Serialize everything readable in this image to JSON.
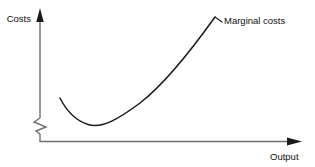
{
  "chart_data": {
    "type": "line",
    "title": "",
    "subtitle": "",
    "xlabel": "Output",
    "ylabel": "Costs",
    "grid": false,
    "legend_position": "inline-annotation",
    "axis_break": {
      "axis": "y",
      "symbol": "zigzag",
      "note": "y-axis broken near origin"
    },
    "annotations": [
      {
        "text": "Marginal costs",
        "target": "curve-upper-end",
        "leader_line": true
      }
    ],
    "series": [
      {
        "name": "Marginal costs",
        "shape": "u-shaped",
        "minimum": {
          "x": 0.21,
          "y": 0.1
        },
        "points": [
          {
            "x": 0.085,
            "y": 0.34
          },
          {
            "x": 0.1,
            "y": 0.24
          },
          {
            "x": 0.13,
            "y": 0.16
          },
          {
            "x": 0.17,
            "y": 0.115
          },
          {
            "x": 0.21,
            "y": 0.1
          },
          {
            "x": 0.26,
            "y": 0.115
          },
          {
            "x": 0.32,
            "y": 0.155
          },
          {
            "x": 0.4,
            "y": 0.235
          },
          {
            "x": 0.5,
            "y": 0.35
          },
          {
            "x": 0.6,
            "y": 0.49
          },
          {
            "x": 0.7,
            "y": 0.64
          },
          {
            "x": 0.8,
            "y": 0.8
          },
          {
            "x": 0.875,
            "y": 0.945
          }
        ]
      }
    ],
    "xlim": [
      0,
      1
    ],
    "ylim": [
      0,
      1
    ]
  },
  "axes": {
    "y": {
      "label": "Costs",
      "arrow": "up"
    },
    "x": {
      "label": "Output",
      "arrow": "right"
    }
  },
  "curve": {
    "label": "Marginal costs",
    "color": "#1a1a1a",
    "path": "M 60 98 C 66 110, 74 120, 88 124.5 C 102 129, 120 118, 140 103 C 162 86, 190 52, 215 17"
  },
  "leader": {
    "path": "M 215 17 L 222 22"
  },
  "colors": {
    "background": "#ffffff",
    "ink": "#1a1a1a",
    "axis": "#6f6f6f",
    "text": "#111111"
  }
}
